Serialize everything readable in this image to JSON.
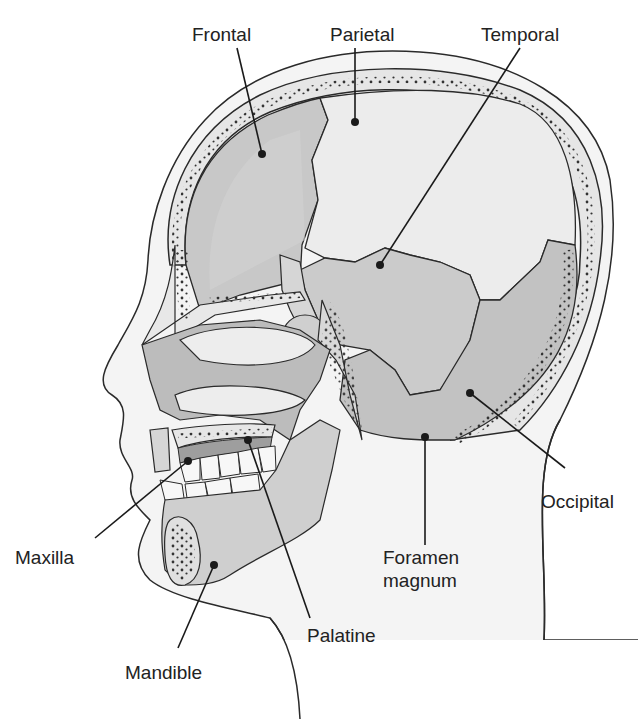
{
  "diagram": {
    "colors": {
      "background": "#ffffff",
      "outline": "#2a2a2a",
      "skin": "#f2f2f2",
      "bone_light": "#e4e4e4",
      "bone_mid": "#c9c9c9",
      "bone_dark": "#a9a9a9",
      "marrow_dots": "#333333"
    },
    "labels": [
      {
        "id": "frontal",
        "text": "Frontal"
      },
      {
        "id": "parietal",
        "text": "Parietal"
      },
      {
        "id": "temporal",
        "text": "Temporal"
      },
      {
        "id": "occipital",
        "text": "Occipital"
      },
      {
        "id": "maxilla",
        "text": "Maxilla"
      },
      {
        "id": "foramen",
        "text": "Foramen",
        "text2": "magnum"
      },
      {
        "id": "palatine",
        "text": "Palatine"
      },
      {
        "id": "mandible",
        "text": "Mandible"
      }
    ]
  }
}
